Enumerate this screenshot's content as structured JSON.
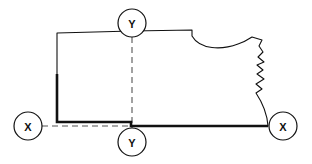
{
  "diagram": {
    "background_color": "#ffffff",
    "line_color": "#111111",
    "dashed_color": "#555555",
    "markers": {
      "section_x_left": {
        "label": "X",
        "cx": 28,
        "cy": 126,
        "r": 14
      },
      "section_x_right": {
        "label": "X",
        "cx": 283,
        "cy": 126,
        "r": 14
      },
      "section_y_top": {
        "label": "Y",
        "cx": 132,
        "cy": 23,
        "r": 14
      },
      "section_y_bottom": {
        "label": "Y",
        "cx": 132,
        "cy": 142,
        "r": 14
      }
    },
    "cut_lines": {
      "x_axis": {
        "from_x": 42,
        "to_x": 269,
        "y": 126
      },
      "y_axis": {
        "x": 132,
        "from_y": 37,
        "to_y": 128
      }
    },
    "outline": {
      "thin_path": "M 57 74 L 57 33 L 132 31 L 192 30 L 192 36 C 200 50 222 50 238 44 C 244 42 249 39 252 37 L 262 40 L 259 46 L 263 52 L 258 57 L 264 62 L 257 65 L 263 70 L 257 74 L 264 79 L 256 84 L 262 89 L 256 93 C 262 102 267 112 268 126",
      "thick_path": "M 57 74 L 57 122 L 131 122 L 131 126 L 268 126",
      "thin_width": 1.1,
      "thick_width": 2.6
    }
  }
}
